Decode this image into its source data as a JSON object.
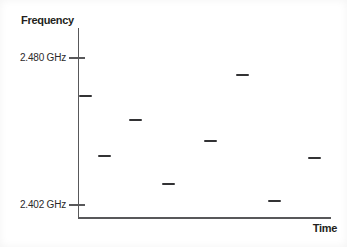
{
  "figure": {
    "background": "#ffffff",
    "axis_color": "#58585a",
    "mark_color": "#323234",
    "text_color": "#231f20"
  },
  "chart_data": {
    "type": "scatter",
    "title": "",
    "xlabel": "Time",
    "ylabel": "Frequency",
    "marker": "horizontal-dash",
    "grid": false,
    "legend": "none",
    "x_ticks": [],
    "y_ticks": [
      {
        "label": "2.480 GHz",
        "value": 2.48
      },
      {
        "label": "2.402 GHz",
        "value": 2.402
      }
    ],
    "ylim": [
      2.396,
      2.487
    ],
    "xlim_description": "unlabeled time axis, hops ordered left to right",
    "points": [
      {
        "slot": 1,
        "x_frac": 0.028,
        "freq_ghz": 2.46
      },
      {
        "slot": 2,
        "x_frac": 0.103,
        "freq_ghz": 2.428
      },
      {
        "slot": 3,
        "x_frac": 0.227,
        "freq_ghz": 2.447
      },
      {
        "slot": 4,
        "x_frac": 0.356,
        "freq_ghz": 2.413
      },
      {
        "slot": 5,
        "x_frac": 0.524,
        "freq_ghz": 2.436
      },
      {
        "slot": 6,
        "x_frac": 0.652,
        "freq_ghz": 2.471
      },
      {
        "slot": 7,
        "x_frac": 0.775,
        "freq_ghz": 2.404
      },
      {
        "slot": 8,
        "x_frac": 0.933,
        "freq_ghz": 2.427
      }
    ]
  }
}
